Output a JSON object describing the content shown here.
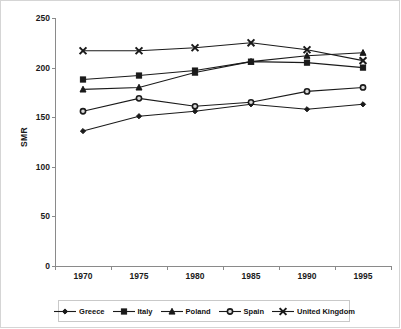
{
  "chart_data": {
    "type": "line",
    "title": "",
    "xlabel": "",
    "ylabel": "SMR",
    "categories": [
      "1970",
      "1975",
      "1980",
      "1985",
      "1990",
      "1995"
    ],
    "ylim": [
      0,
      250
    ],
    "yticks": [
      0,
      50,
      100,
      150,
      200,
      250
    ],
    "grid": false,
    "legend_position": "bottom",
    "series": [
      {
        "name": "Greece",
        "marker": "diamond",
        "values": [
          136,
          151,
          156,
          163,
          158,
          163
        ]
      },
      {
        "name": "Italy",
        "marker": "square",
        "values": [
          188,
          192,
          197,
          206,
          205,
          200
        ]
      },
      {
        "name": "Poland",
        "marker": "triangle",
        "values": [
          178,
          180,
          195,
          206,
          212,
          215
        ]
      },
      {
        "name": "Spain",
        "marker": "circle",
        "values": [
          156,
          169,
          161,
          165,
          176,
          180
        ]
      },
      {
        "name": "United Kingdom",
        "marker": "cross",
        "values": [
          217,
          217,
          220,
          225,
          218,
          207
        ]
      }
    ]
  },
  "axis": {
    "y_title": "SMR",
    "y_tick_labels": [
      "250",
      "200",
      "150",
      "100",
      "50",
      "0"
    ],
    "x_tick_labels": [
      "1970",
      "1975",
      "1980",
      "1985",
      "1990",
      "1995"
    ]
  },
  "legend": {
    "items": [
      {
        "label": "Greece",
        "marker": "diamond"
      },
      {
        "label": "Italy",
        "marker": "square"
      },
      {
        "label": "Poland",
        "marker": "triangle"
      },
      {
        "label": "Spain",
        "marker": "circle"
      },
      {
        "label": "United Kingdom",
        "marker": "cross"
      }
    ]
  },
  "colors": {
    "line": "#1a1a1a",
    "axis": "#8a8a8a",
    "text": "#1a1a1a",
    "legend_border": "#c9c9c9",
    "marker_fill_open": "#d8d8d8",
    "background": "#ffffff"
  }
}
